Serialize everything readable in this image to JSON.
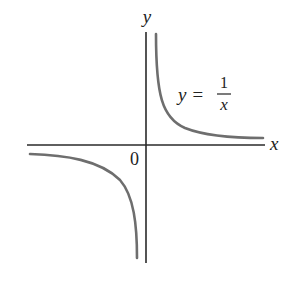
{
  "diagram": {
    "type": "function-graph",
    "function": "y = 1/x",
    "axes": {
      "x_label": "x",
      "y_label": "y",
      "origin_label": "0"
    },
    "equation_label": {
      "lhs": "y =",
      "numerator": "1",
      "denominator": "x"
    },
    "branches": [
      "first-quadrant",
      "third-quadrant"
    ],
    "colors": {
      "axis": "#2a2a2a",
      "curve": "#6e6e6e"
    }
  }
}
